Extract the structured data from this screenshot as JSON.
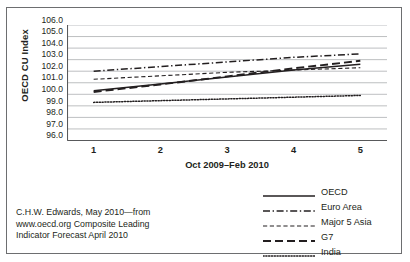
{
  "chart_data": {
    "type": "line",
    "title": "",
    "xlabel": "Oct 2009–Feb 2010",
    "ylabel": "OECD CU Index",
    "x": [
      1,
      2,
      3,
      4,
      5
    ],
    "xticklabels": [
      "1",
      "2",
      "3",
      "4",
      "5"
    ],
    "xlim": [
      0.6,
      5.4
    ],
    "ylim": [
      96.0,
      106.0
    ],
    "yticklabels": [
      "106.0",
      "105.0",
      "104.0",
      "103.0",
      "102.0",
      "101.0",
      "100.0",
      "99.0",
      "98.0",
      "97.0",
      "96.0"
    ],
    "yticks": [
      106.0,
      105.0,
      104.0,
      103.0,
      102.0,
      101.0,
      100.0,
      99.0,
      98.0,
      97.0,
      96.0
    ],
    "grid": "horizontal",
    "legend_position": "below-right",
    "series": [
      {
        "name": "OECD",
        "style": "solid",
        "color": "#231f20",
        "values": [
          100.3,
          100.9,
          101.5,
          102.1,
          102.6
        ]
      },
      {
        "name": "Euro Area",
        "style": "dash-dot",
        "color": "#231f20",
        "values": [
          102.0,
          102.4,
          102.8,
          103.2,
          103.5
        ]
      },
      {
        "name": "Major 5 Asia",
        "style": "dashed-short",
        "color": "#231f20",
        "values": [
          101.3,
          101.6,
          101.9,
          102.1,
          102.3
        ]
      },
      {
        "name": "G7",
        "style": "dashed-long",
        "color": "#231f20",
        "values": [
          100.2,
          100.85,
          101.55,
          102.25,
          102.9
        ]
      },
      {
        "name": "India",
        "style": "dotted",
        "color": "#231f20",
        "values": [
          99.3,
          99.45,
          99.6,
          99.75,
          99.9
        ]
      }
    ]
  },
  "caption": {
    "lines": [
      "C.H.W. Edwards, May 2010—from",
      "www.oecd.org Composite Leading",
      "Indicator Forecast April 2010"
    ]
  }
}
